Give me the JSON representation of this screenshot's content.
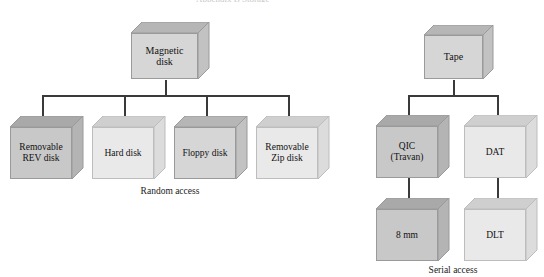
{
  "figure": {
    "title_cut_off": "Appendix B  Storage",
    "background": "#ffffff",
    "line_color": "#3a3a3a"
  },
  "palette": {
    "dark_front": "#c8c8c8",
    "dark_top": "#a9a9a9",
    "dark_side": "#b4b4b4",
    "light_front": "#e9e9e9",
    "light_top": "#cfcfcf",
    "light_side": "#dcdcdc",
    "mid_front": "#d6d6d6",
    "mid_top": "#b6b6b6",
    "mid_side": "#c2c2c2",
    "edge": "#9a9a9a",
    "text": "#111111"
  },
  "trees": {
    "random_access": {
      "caption": "Random access",
      "root": {
        "label": "Magnetic disk",
        "line1": "Magnetic",
        "line2": "disk"
      },
      "children": [
        {
          "label": "Removable REV disk",
          "line1": "Removable",
          "line2": "REV disk",
          "tone": "dark"
        },
        {
          "label": "Hard disk",
          "line1": "Hard disk",
          "line2": "",
          "tone": "light"
        },
        {
          "label": "Floppy disk",
          "line1": "Floppy disk",
          "line2": "",
          "tone": "mid"
        },
        {
          "label": "Removable Zip disk",
          "line1": "Removable",
          "line2": "Zip disk",
          "tone": "light"
        }
      ]
    },
    "serial_access": {
      "caption": "Serial access",
      "root": {
        "label": "Tape",
        "line1": "Tape",
        "line2": ""
      },
      "children": [
        {
          "label": "QIC (Travan)",
          "line1": "QIC",
          "line2": "(Travan)",
          "tone": "dark",
          "child": {
            "label": "8 mm",
            "line1": "8 mm",
            "line2": "",
            "tone": "dark"
          }
        },
        {
          "label": "DAT",
          "line1": "DAT",
          "line2": "",
          "tone": "light",
          "child": {
            "label": "DLT",
            "line1": "DLT",
            "line2": "",
            "tone": "light"
          }
        }
      ]
    }
  }
}
